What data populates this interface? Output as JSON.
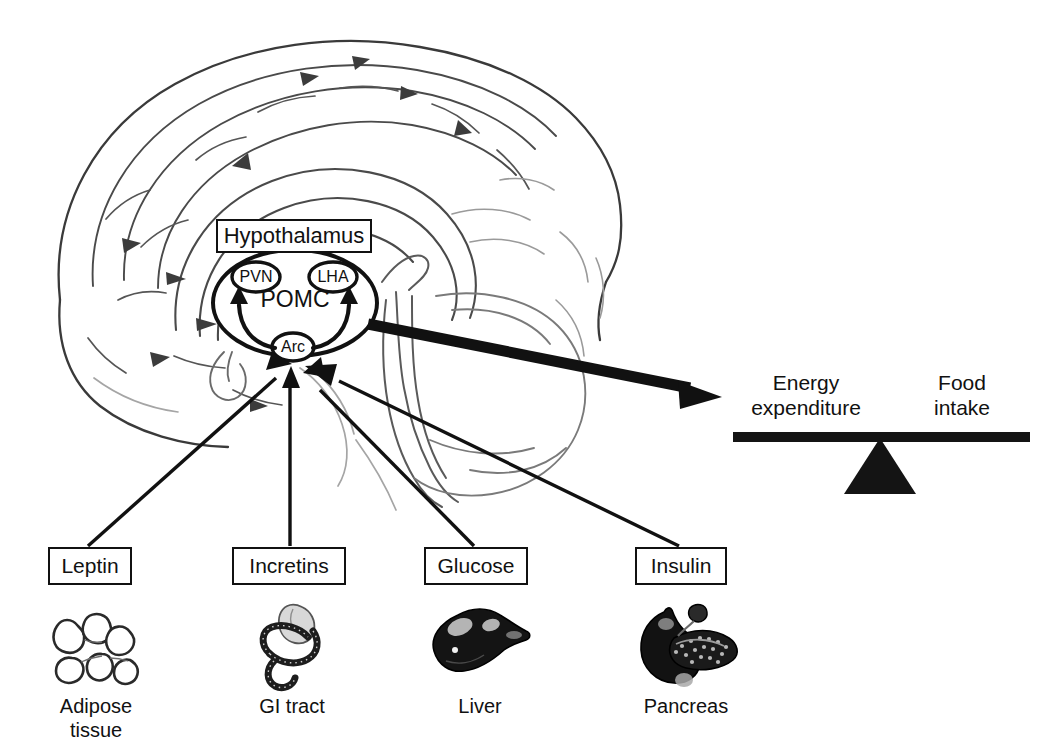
{
  "figure": {
    "type": "diagram"
  },
  "brain": {
    "region_box_label": "Hypothalamus",
    "nuclei": [
      {
        "id": "pvn",
        "label": "PVN"
      },
      {
        "id": "lha",
        "label": "LHA"
      },
      {
        "id": "arc",
        "label": "Arc"
      }
    ],
    "neuron_population_label": "POMC"
  },
  "signals": [
    {
      "id": "leptin",
      "label": "Leptin",
      "organ_label": "Adipose\ntissue",
      "organ_icon": "adipose-tissue-icon"
    },
    {
      "id": "incretins",
      "label": "Incretins",
      "organ_label": "GI tract",
      "organ_icon": "gi-tract-icon"
    },
    {
      "id": "glucose",
      "label": "Glucose",
      "organ_label": "Liver",
      "organ_icon": "liver-icon"
    },
    {
      "id": "insulin",
      "label": "Insulin",
      "organ_label": "Pancreas",
      "organ_icon": "pancreas-icon"
    }
  ],
  "balance": {
    "left_label": "Energy\nexpenditure",
    "right_label": "Food\nintake",
    "state": "level"
  },
  "colors": {
    "ink": "#111111",
    "line": "#1a1a1a",
    "background": "#ffffff",
    "brain_outline": "#3a3a3a",
    "brain_faint": "#8a8a8a"
  }
}
